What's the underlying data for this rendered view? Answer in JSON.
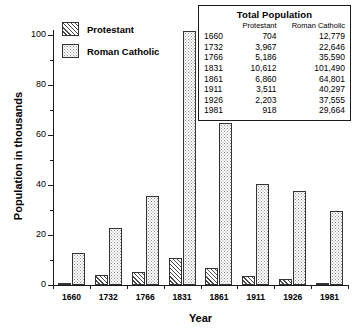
{
  "chart_data": {
    "type": "bar",
    "title": "",
    "xlabel": "Year",
    "ylabel": "Population in thousands",
    "categories": [
      "1660",
      "1732",
      "1766",
      "1831",
      "1861",
      "1911",
      "1926",
      "1981"
    ],
    "series": [
      {
        "name": "Protestant",
        "values": [
          0.704,
          3.967,
          5.186,
          10.612,
          6.86,
          3.511,
          2.203,
          0.918
        ]
      },
      {
        "name": "Roman Catholic",
        "values": [
          12.779,
          22.646,
          35.59,
          101.49,
          64.801,
          40.297,
          37.555,
          29.664
        ]
      }
    ],
    "ylim": [
      0,
      105
    ],
    "yticks_major": [
      0,
      20,
      40,
      60,
      80,
      100
    ],
    "yticks_minor": [
      10,
      30,
      50,
      70,
      90
    ],
    "grid": false,
    "legend_position": "top-left",
    "units": "thousands"
  },
  "legend": {
    "items": [
      {
        "label": "Protestant",
        "pattern": "diagonal-hatch"
      },
      {
        "label": "Roman Catholic",
        "pattern": "dotted-stipple"
      }
    ]
  },
  "inset_table": {
    "title": "Total Population",
    "columns": [
      "",
      "Protestant",
      "Roman Catholic"
    ],
    "rows": [
      {
        "year": "1660",
        "protestant": "704",
        "catholic": "12,779"
      },
      {
        "year": "1732",
        "protestant": "3,967",
        "catholic": "22,646"
      },
      {
        "year": "1766",
        "protestant": "5,186",
        "catholic": "35,590"
      },
      {
        "year": "1831",
        "protestant": "10,612",
        "catholic": "101,490"
      },
      {
        "year": "1861",
        "protestant": "6,860",
        "catholic": "64,801"
      },
      {
        "year": "1911",
        "protestant": "3,511",
        "catholic": "40,297"
      },
      {
        "year": "1926",
        "protestant": "2,203",
        "catholic": "37,555"
      },
      {
        "year": "1981",
        "protestant": "918",
        "catholic": "29,664"
      }
    ]
  },
  "axes": {
    "y_title": "Population in thousands",
    "x_title": "Year",
    "y_tick_labels": [
      "0",
      "20",
      "40",
      "60",
      "80",
      "100"
    ]
  }
}
